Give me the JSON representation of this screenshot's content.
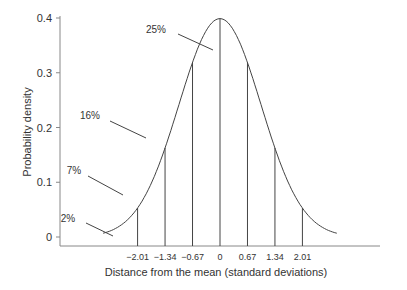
{
  "chart_data": {
    "type": "line",
    "title": "",
    "xlabel": "Distance from the mean (standard deviations)",
    "ylabel": "Probability density",
    "ylim": [
      0,
      0.4
    ],
    "yticks": [
      "0",
      "0.1",
      "0.2",
      "0.3",
      "0.4"
    ],
    "xticks": [
      "−2.01",
      "−1.34",
      "−0.67",
      "0",
      "0.67",
      "1.34",
      "2.01"
    ],
    "xtick_values": [
      -2.01,
      -1.34,
      -0.67,
      0,
      0.67,
      1.34,
      2.01
    ],
    "series": [
      {
        "name": "Standard normal density",
        "x_range": [
          -3,
          3
        ],
        "peak": 0.4
      }
    ],
    "vertical_lines": [
      -2.01,
      -1.34,
      -0.67,
      0,
      0.67,
      1.34,
      2.01
    ],
    "annotations": [
      {
        "text": "2%",
        "region": "x < -2.01"
      },
      {
        "text": "7%",
        "region": "-2.01 to -1.34"
      },
      {
        "text": "16%",
        "region": "-1.34 to -0.67"
      },
      {
        "text": "25%",
        "region": "-0.67 to 0"
      }
    ],
    "grid": false,
    "legend": "none"
  }
}
